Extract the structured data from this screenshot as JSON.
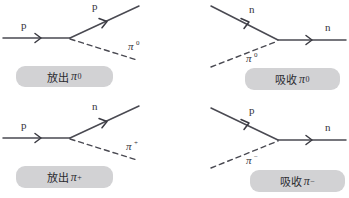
{
  "figure": {
    "background_color": "#ffffff",
    "line_color": "#4a4a52",
    "caption_background": "#d2d2d4",
    "caption_text_color": "#2b2b30"
  },
  "diagrams": [
    {
      "id": "emit-pi-zero",
      "position": "top-left",
      "incoming_particle": "p",
      "outgoing_particle": "p",
      "meson": "π",
      "meson_charge": "0",
      "caption_text": "放出",
      "caption_pi": "π",
      "caption_sup": "0"
    },
    {
      "id": "absorb-pi-zero",
      "position": "top-right",
      "incoming_particle": "n",
      "outgoing_particle": "n",
      "meson": "π",
      "meson_charge": "0",
      "caption_text": "吸收",
      "caption_pi": "π",
      "caption_sup": "0"
    },
    {
      "id": "emit-pi-plus",
      "position": "bottom-left",
      "incoming_particle": "p",
      "outgoing_particle": "n",
      "meson": "π",
      "meson_charge": "+",
      "caption_text": "放出",
      "caption_pi": "π",
      "caption_sup": "+"
    },
    {
      "id": "absorb-pi-minus",
      "position": "bottom-right",
      "incoming_particle": "p",
      "outgoing_particle": "n",
      "meson": "π",
      "meson_charge": "−",
      "caption_text": "吸收",
      "caption_pi": "π",
      "caption_sup": "−"
    }
  ]
}
